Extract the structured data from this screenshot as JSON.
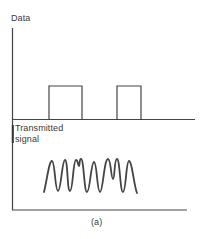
{
  "figure": {
    "caption": "(a)",
    "top_panel": {
      "ylabel": "Data",
      "signal_type": "binary-data-pulses",
      "pulses": [
        {
          "x_start": 49,
          "x_end": 82,
          "level": "high"
        },
        {
          "x_start": 117,
          "x_end": 141,
          "level": "high"
        }
      ],
      "baseline_level": "low"
    },
    "bottom_panel": {
      "ylabel_line1": "Transmitted",
      "ylabel_line2": "signal",
      "signal_type": "modulated-carrier-waveform",
      "peaks_count": 9
    },
    "colors": {
      "line": "#444444",
      "text": "#3a3a3a",
      "background": "#ffffff"
    }
  }
}
